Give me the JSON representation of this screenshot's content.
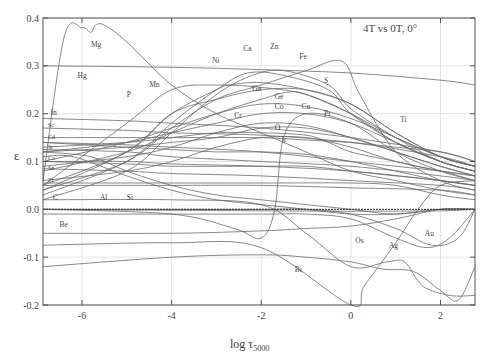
{
  "chart_data": {
    "type": "line",
    "title": "4T vs 0T, 0°",
    "xlabel": "log τ5000",
    "xlabel_main": "log τ",
    "xlabel_sub": "5000",
    "ylabel": "ε",
    "xlim": [
      -6.87,
      2.77
    ],
    "ylim": [
      -0.2,
      0.4
    ],
    "xticks": [
      "-6",
      "-4",
      "-2",
      "0",
      "2"
    ],
    "yticks": [
      "0.4",
      "0.3",
      "0.2",
      "0.1",
      "0.0",
      "-0.1",
      "-0.2"
    ],
    "grid": true,
    "legend_position": "none (inline element labels)",
    "series": [
      {
        "name": "Mg",
        "x": [
          -6.87,
          -6.4,
          -6.0,
          -5.8,
          -5.7,
          -5.5,
          -5.0,
          -4.0,
          -3.0,
          -2.0,
          -1.0,
          0,
          1,
          2,
          2.77
        ],
        "y": [
          0.06,
          0.36,
          0.38,
          0.37,
          0.385,
          0.385,
          0.35,
          0.26,
          0.2,
          0.16,
          0.12,
          0.08,
          0.06,
          0.04,
          0.03
        ]
      },
      {
        "name": "Hg",
        "x": [
          -6.87,
          -4,
          -2,
          0,
          2,
          2.77
        ],
        "y": [
          0.3,
          0.297,
          0.292,
          0.285,
          0.27,
          0.26
        ]
      },
      {
        "name": "Mn",
        "x": [
          -6.87,
          -5,
          -4,
          -3,
          -2,
          -1,
          0,
          1,
          2,
          2.77
        ],
        "y": [
          0.05,
          0.18,
          0.25,
          0.26,
          0.255,
          0.24,
          0.2,
          0.14,
          0.1,
          0.08
        ]
      },
      {
        "name": "P",
        "x": [
          -6.87,
          -5,
          -4,
          -3,
          -2,
          -1,
          0,
          1,
          2,
          2.77
        ],
        "y": [
          0.04,
          0.12,
          0.2,
          0.23,
          0.25,
          0.25,
          0.22,
          0.16,
          0.11,
          0.09
        ]
      },
      {
        "name": "Ca",
        "x": [
          -6.87,
          -5,
          -4,
          -3,
          -2.3,
          -1.5,
          -0.5,
          0,
          1,
          2,
          2.77
        ],
        "y": [
          0.03,
          0.1,
          0.18,
          0.25,
          0.285,
          0.28,
          0.25,
          0.2,
          0.14,
          0.1,
          0.08
        ]
      },
      {
        "name": "Zn",
        "x": [
          -6.87,
          -5,
          -4,
          -3,
          -2.2,
          -1.5,
          -0.5,
          0,
          1,
          2,
          2.77
        ],
        "y": [
          0.02,
          0.08,
          0.16,
          0.24,
          0.28,
          0.29,
          0.26,
          0.21,
          0.15,
          0.1,
          0.08
        ]
      },
      {
        "name": "Ni",
        "x": [
          -6.87,
          -5,
          -4,
          -3,
          -2.7,
          -2,
          -1,
          0,
          1,
          2,
          2.77
        ],
        "y": [
          0.05,
          0.12,
          0.2,
          0.25,
          0.26,
          0.265,
          0.25,
          0.22,
          0.16,
          0.11,
          0.09
        ]
      },
      {
        "name": "Fe",
        "x": [
          -6.87,
          -5,
          -4,
          -3,
          -2.0,
          -1,
          -0.2,
          0.2,
          1,
          2,
          2.77
        ],
        "y": [
          0.04,
          0.1,
          0.17,
          0.23,
          0.26,
          0.29,
          0.31,
          0.24,
          0.12,
          0.06,
          0.04
        ]
      },
      {
        "name": "S",
        "x": [
          -6.87,
          -5,
          -4,
          -3,
          -2,
          -1.4,
          -1,
          0,
          1,
          2,
          2.77
        ],
        "y": [
          0.08,
          0.12,
          0.16,
          0.2,
          0.23,
          0.245,
          0.24,
          0.2,
          0.15,
          0.11,
          0.09
        ]
      },
      {
        "name": "Ga",
        "x": [
          -6.87,
          -5,
          -4,
          -3,
          -2,
          -1,
          0,
          1,
          2,
          2.77
        ],
        "y": [
          0.1,
          0.14,
          0.17,
          0.2,
          0.22,
          0.215,
          0.19,
          0.15,
          0.11,
          0.09
        ]
      },
      {
        "name": "Ge",
        "x": [
          -6.87,
          -5,
          -4,
          -3,
          -2,
          -1,
          0,
          1,
          2,
          2.77
        ],
        "y": [
          0.12,
          0.14,
          0.16,
          0.18,
          0.2,
          0.2,
          0.18,
          0.14,
          0.1,
          0.08
        ]
      },
      {
        "name": "Co",
        "x": [
          -6.87,
          -5,
          -4,
          -3,
          -2,
          -1,
          0,
          1,
          2,
          2.77
        ],
        "y": [
          0.09,
          0.11,
          0.13,
          0.16,
          0.18,
          0.175,
          0.15,
          0.12,
          0.09,
          0.07
        ]
      },
      {
        "name": "Cu",
        "x": [
          -6.87,
          -5,
          -4,
          -3,
          -2,
          -1,
          0,
          1,
          2,
          2.77
        ],
        "y": [
          0.12,
          0.13,
          0.14,
          0.15,
          0.17,
          0.17,
          0.15,
          0.12,
          0.09,
          0.07
        ]
      },
      {
        "name": "Pr",
        "x": [
          -6.87,
          -5,
          -4,
          -3,
          -2,
          -1,
          -0.5,
          0,
          1,
          2,
          2.77
        ],
        "y": [
          0.13,
          0.14,
          0.15,
          0.16,
          0.16,
          0.155,
          0.14,
          0.12,
          0.1,
          0.08,
          0.07
        ]
      },
      {
        "name": "Cr",
        "x": [
          -6.87,
          -5,
          -4,
          -3,
          -2,
          -1,
          0,
          1,
          2,
          2.77
        ],
        "y": [
          0.06,
          0.08,
          0.1,
          0.13,
          0.15,
          0.15,
          0.13,
          0.1,
          0.08,
          0.06
        ]
      },
      {
        "name": "O",
        "x": [
          -6.87,
          -5,
          -4,
          -3,
          -2,
          -1,
          0,
          1,
          2,
          2.77
        ],
        "y": [
          0.14,
          0.13,
          0.125,
          0.12,
          0.12,
          0.115,
          0.1,
          0.08,
          0.06,
          0.05
        ]
      },
      {
        "name": "Ir",
        "x": [
          -6.87,
          -5,
          -4,
          -3,
          -2,
          -1,
          0,
          1,
          2,
          2.77
        ],
        "y": [
          0.1,
          0.095,
          0.09,
          0.09,
          0.09,
          0.09,
          0.08,
          0.07,
          0.06,
          0.05
        ]
      },
      {
        "name": "Ti",
        "x": [
          -6.87,
          -5,
          -4,
          -3,
          -2,
          -1,
          0,
          1,
          2,
          2.77
        ],
        "y": [
          0.15,
          0.15,
          0.15,
          0.15,
          0.15,
          0.145,
          0.14,
          0.13,
          0.12,
          0.1
        ]
      },
      {
        "name": "In",
        "x": [
          -6.87,
          -5,
          -4,
          -2,
          0,
          2,
          2.77
        ],
        "y": [
          0.19,
          0.185,
          0.18,
          0.17,
          0.15,
          0.12,
          0.1
        ]
      },
      {
        "name": "Sc",
        "x": [
          -6.87,
          -5,
          -4,
          -2,
          0,
          2,
          2.77
        ],
        "y": [
          0.17,
          0.165,
          0.16,
          0.155,
          0.14,
          0.11,
          0.09
        ]
      },
      {
        "name": "Cd",
        "x": [
          -6.87,
          -5,
          -4,
          -2,
          0,
          2,
          2.77
        ],
        "y": [
          0.14,
          0.135,
          0.13,
          0.12,
          0.1,
          0.08,
          0.07
        ]
      },
      {
        "name": "Sr",
        "x": [
          -6.87,
          -5,
          -4,
          -2,
          0,
          2,
          2.77
        ],
        "y": [
          0.125,
          0.12,
          0.11,
          0.1,
          0.09,
          0.07,
          0.06
        ]
      },
      {
        "name": "Co2",
        "x": [
          -6.87,
          -5,
          -4,
          -2,
          0,
          2,
          2.77
        ],
        "y": [
          0.1,
          0.1,
          0.095,
          0.09,
          0.08,
          0.06,
          0.05
        ]
      },
      {
        "name": "Sn",
        "x": [
          -6.87,
          -5,
          -4,
          -2,
          0,
          2,
          2.77
        ],
        "y": [
          0.085,
          0.08,
          0.075,
          0.07,
          0.06,
          0.05,
          0.04
        ]
      },
      {
        "name": "Zr",
        "x": [
          -6.87,
          -5,
          -4,
          -2,
          0,
          2,
          2.77
        ],
        "y": [
          0.05,
          0.05,
          0.05,
          0.05,
          0.045,
          0.04,
          0.03
        ]
      },
      {
        "name": "C",
        "x": [
          -6.87,
          -4,
          -2,
          0,
          1,
          2,
          2.77
        ],
        "y": [
          0.055,
          0.055,
          0.055,
          0.055,
          0.05,
          0.03,
          0.02
        ]
      },
      {
        "name": "Al",
        "x": [
          -6.87,
          -6.2,
          -5,
          -4,
          -3,
          -2,
          -1,
          0,
          1,
          2,
          2.77
        ],
        "y": [
          0.11,
          0.11,
          0.07,
          0.04,
          0.02,
          0.01,
          0.0,
          -0.01,
          -0.01,
          0.0,
          0.0
        ]
      },
      {
        "name": "Si",
        "x": [
          -6.87,
          -5.8,
          -5,
          -4,
          -3,
          -2,
          -1,
          0,
          1,
          2,
          2.77
        ],
        "y": [
          0.12,
          0.11,
          0.08,
          0.05,
          0.03,
          0.02,
          0.01,
          0.0,
          -0.01,
          0.0,
          0.0
        ]
      },
      {
        "name": "K",
        "x": [
          -6.87,
          -4,
          -2.6,
          -2.0,
          -1.7,
          -1.5,
          -1,
          0,
          1,
          2,
          2.77
        ],
        "y": [
          0.0,
          -0.01,
          -0.04,
          -0.06,
          0.0,
          0.15,
          0.2,
          0.18,
          0.12,
          0.08,
          0.06
        ]
      },
      {
        "name": "Be",
        "x": [
          -6.87,
          -4,
          -2,
          0,
          2,
          2.77
        ],
        "y": [
          0.0,
          -0.002,
          -0.003,
          -0.004,
          -0.003,
          0.0
        ]
      },
      {
        "name": "Os",
        "x": [
          -6.87,
          -4,
          -2,
          -1,
          0,
          1,
          2,
          2.77
        ],
        "y": [
          -0.05,
          -0.05,
          -0.045,
          -0.04,
          -0.035,
          -0.02,
          0.0,
          0.0
        ]
      },
      {
        "name": "Ag",
        "x": [
          -6.87,
          -4,
          -2,
          0,
          0.3,
          1,
          1.5,
          2,
          2.77
        ],
        "y": [
          -0.075,
          -0.07,
          -0.08,
          -0.2,
          -0.16,
          -0.07,
          0.0,
          0.05,
          0.06
        ]
      },
      {
        "name": "Au",
        "x": [
          -6.87,
          -4,
          -2,
          -1,
          0,
          1,
          1.7,
          2.2,
          2.77
        ],
        "y": [
          -0.01,
          -0.01,
          -0.01,
          -0.01,
          -0.02,
          -0.06,
          -0.08,
          -0.06,
          0.0
        ]
      },
      {
        "name": "Au2",
        "x": [
          -6.87,
          -4,
          -2,
          -1,
          0,
          1,
          1.8,
          2.4,
          2.77
        ],
        "y": [
          0.0,
          0.0,
          0.0,
          0.0,
          -0.01,
          -0.04,
          -0.075,
          -0.06,
          0.0
        ]
      },
      {
        "name": "Bi",
        "x": [
          -6.87,
          -4,
          -2,
          -1,
          0,
          0.7,
          1.4,
          2,
          2.4,
          2.77
        ],
        "y": [
          -0.12,
          -0.1,
          -0.095,
          -0.1,
          -0.11,
          -0.125,
          -0.13,
          -0.17,
          -0.19,
          -0.12
        ]
      },
      {
        "name": "Bi2",
        "x": [
          -6.87,
          -4,
          -2,
          -1,
          0,
          0.8,
          1.2,
          1.6,
          2.2,
          2.77
        ],
        "y": [
          0.02,
          0.02,
          0.01,
          -0.05,
          -0.12,
          -0.11,
          -0.11,
          -0.16,
          -0.18,
          -0.18
        ]
      }
    ],
    "annotations": [
      {
        "text": "Mg",
        "x": -5.8,
        "y": 0.34
      },
      {
        "text": "Hg",
        "x": -6.1,
        "y": 0.275
      },
      {
        "text": "Mn",
        "x": -4.5,
        "y": 0.255
      },
      {
        "text": "P",
        "x": -5.0,
        "y": 0.235
      },
      {
        "text": "Ca",
        "x": -2.4,
        "y": 0.33
      },
      {
        "text": "Zn",
        "x": -1.8,
        "y": 0.335
      },
      {
        "text": "Ni",
        "x": -3.1,
        "y": 0.305
      },
      {
        "text": "Fe",
        "x": -1.15,
        "y": 0.315
      },
      {
        "text": "S",
        "x": -0.6,
        "y": 0.265
      },
      {
        "text": "Ga",
        "x": -2.2,
        "y": 0.247
      },
      {
        "text": "Ge",
        "x": -1.7,
        "y": 0.23
      },
      {
        "text": "Co",
        "x": -1.7,
        "y": 0.21
      },
      {
        "text": "Cu",
        "x": -1.1,
        "y": 0.21
      },
      {
        "text": "Pr",
        "x": -0.6,
        "y": 0.195
      },
      {
        "text": "Cr",
        "x": -2.6,
        "y": 0.19
      },
      {
        "text": "O",
        "x": -1.7,
        "y": 0.165
      },
      {
        "text": "Ir",
        "x": -1.55,
        "y": 0.14
      },
      {
        "text": "Ti",
        "x": 1.1,
        "y": 0.183
      },
      {
        "text": "In",
        "x": -6.7,
        "y": 0.197
      },
      {
        "text": "C",
        "x": -6.65,
        "y": 0.02
      },
      {
        "text": "Al",
        "x": -5.6,
        "y": 0.02
      },
      {
        "text": "Si",
        "x": -5.0,
        "y": 0.02
      },
      {
        "text": "Be",
        "x": -6.5,
        "y": -0.037
      },
      {
        "text": "Bi",
        "x": -1.25,
        "y": -0.13
      },
      {
        "text": "Os",
        "x": 0.1,
        "y": -0.07
      },
      {
        "text": "Ag",
        "x": 0.85,
        "y": -0.08
      },
      {
        "text": "Au",
        "x": 1.65,
        "y": -0.055
      }
    ]
  },
  "left_labels": [
    "Sc",
    "Cd",
    "Sr",
    "Co",
    "Sn",
    "Zr"
  ]
}
